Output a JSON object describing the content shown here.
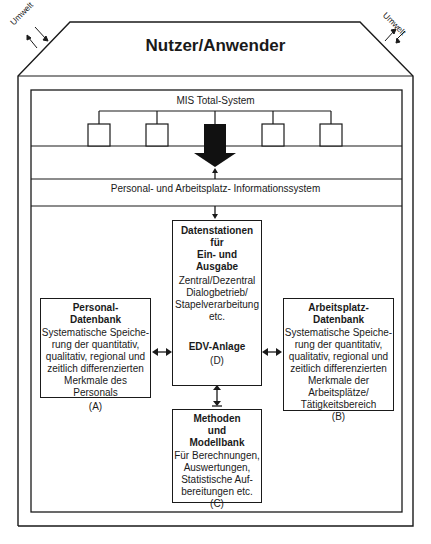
{
  "diagram": {
    "title": "Nutzer/Anwender",
    "environment_label_left": "Umwelt",
    "environment_label_right": "Umwelt",
    "mis_label": "MIS Total-System",
    "pai_label": "Personal- und Arbeitsplatz- Informationssystem",
    "mis_subsystem_count": 5,
    "boxes": {
      "datenstationen": {
        "heading": [
          "Datenstationen",
          "für",
          "Ein- und",
          "Ausgabe"
        ],
        "body": [
          "Zentral/Dezentral",
          "Dialogbetrieb/",
          "Stapelverarbeitung",
          "etc."
        ]
      },
      "edv": {
        "heading": "EDV-Anlage",
        "id": "(D)"
      },
      "personal": {
        "heading": [
          "Personal-",
          "Datenbank"
        ],
        "body": [
          "Systematische Speiche-",
          "rung der quantitativ,",
          "qualitativ, regional und",
          "zeitlich differenzierten",
          "Merkmale des Personals"
        ],
        "id": "(A)"
      },
      "arbeitsplatz": {
        "heading": [
          "Arbeitsplatz-",
          "Datenbank"
        ],
        "body": [
          "Systematische Speiche-",
          "rung der quantitativ,",
          "qualitativ, regional und",
          "zeitlich differenzierten",
          "Merkmale der",
          "Arbeitsplätze/",
          "Tätigkeitsbereich"
        ],
        "id": "(B)"
      },
      "methoden": {
        "heading": [
          "Methoden",
          "und",
          "Modellbank"
        ],
        "body": [
          "Für Berechnungen,",
          "Auswertungen,",
          "Statistische Auf-",
          "bereitungen etc."
        ],
        "id": "(C)"
      }
    }
  }
}
